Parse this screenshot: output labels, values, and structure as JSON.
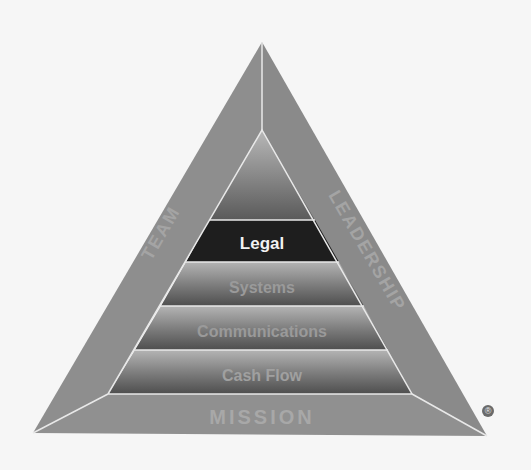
{
  "diagram": {
    "type": "pyramid",
    "sides": {
      "left": "TEAM",
      "right": "LEADERSHIP",
      "bottom": "MISSION"
    },
    "levels": [
      {
        "label": "",
        "highlighted": false
      },
      {
        "label": "Legal",
        "highlighted": true
      },
      {
        "label": "Systems",
        "highlighted": false
      },
      {
        "label": "Communications",
        "highlighted": false
      },
      {
        "label": "Cash Flow",
        "highlighted": false
      }
    ],
    "registered_mark": "®",
    "colors": {
      "frame": "#8c8c8c",
      "highlight": "#1e1e1e",
      "band_dark": "#5a5a5a",
      "band_light": "#a8a8a8",
      "edge": "#e8e8e8",
      "background": "#f6f6f6"
    }
  }
}
